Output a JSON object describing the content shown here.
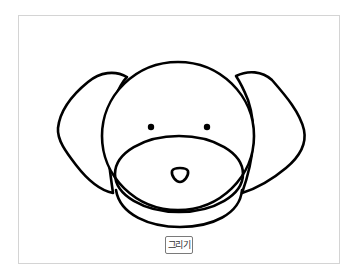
{
  "drawing": {
    "subject": "dog-face",
    "stroke_color": "#000000",
    "background": "#ffffff"
  },
  "controls": {
    "draw_button_label": "그리기"
  }
}
